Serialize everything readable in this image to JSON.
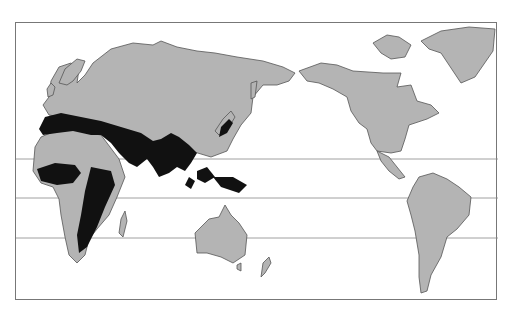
{
  "figure": {
    "type": "world-map",
    "projection": "Pacific-centered equirectangular",
    "legend": null,
    "shaded_region_description": "Dark shading over southern Europe/Mediterranean, North Africa (Sahara band), Sahel, East and Southeast Africa, Middle East, Central and South Asia, southern China, Japan, Southeast Asia, Indonesia and New Guinea",
    "colors": {
      "land": "#b4b4b4",
      "highlighted_region": "#111111",
      "border": "#555555",
      "ocean": "#ffffff",
      "latitude_lines": "#888888"
    },
    "latitude_lines_y": [
      158,
      197,
      237
    ],
    "regions_shown": [
      "Europe",
      "Africa",
      "Asia",
      "Australia",
      "New Zealand",
      "North America",
      "Greenland",
      "South America"
    ]
  }
}
